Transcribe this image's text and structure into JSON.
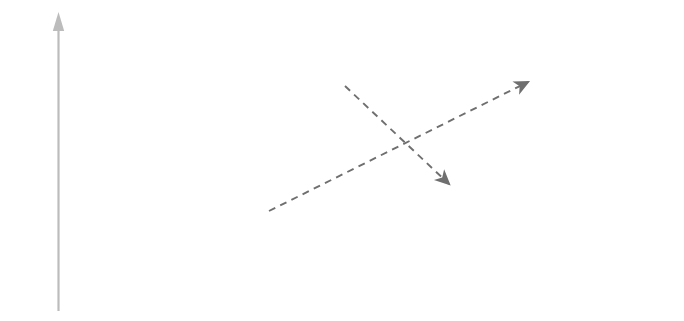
{
  "figure": {
    "background": "#ffffff",
    "box_stroke": "#444444",
    "arrow_color": "#8d8d8d",
    "dashed_arrow_color": "#6f6f6f",
    "axis_color": "#b4b4b4",
    "text_color": "#3a3a3a"
  },
  "axis": {
    "label": "Potential energy",
    "direction": "up",
    "arrowhead": "up-arrow-icon"
  },
  "left": {
    "caption_line1": "3d orbitals are",
    "caption_line2": "empty (Ca)",
    "orbitals": [
      {
        "id": "left-3d",
        "label": "3d",
        "cells": 5,
        "electrons": [
          "",
          "",
          "",
          "",
          ""
        ]
      },
      {
        "id": "left-4s",
        "label": "4s",
        "cells": 1,
        "electrons": [
          "up-down"
        ]
      }
    ]
  },
  "right": {
    "caption_line1": "3d orbitals occupied (Sc)",
    "orbitals": [
      {
        "id": "right-4s",
        "label": "4s",
        "cells": 1,
        "electrons": [
          "up-down"
        ]
      },
      {
        "id": "right-3d",
        "label": "3d",
        "cells": 5,
        "electrons": [
          "up",
          "",
          "",
          "",
          ""
        ]
      }
    ]
  },
  "glyphs": {
    "spin_up": "↑",
    "spin_down": "↓"
  },
  "transitions": [
    {
      "id": "3d-to-4s",
      "from": "left-3d",
      "to": "right-4s",
      "style": "dashed"
    },
    {
      "id": "4s-to-3d",
      "from": "left-4s",
      "to": "right-3d",
      "style": "dashed"
    }
  ]
}
